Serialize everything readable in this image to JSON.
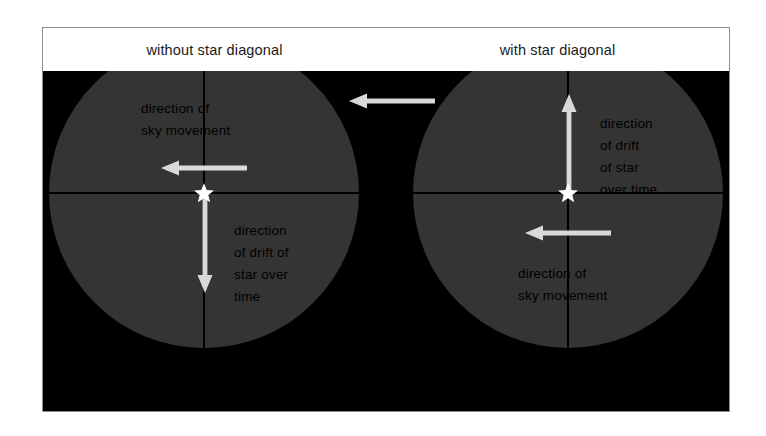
{
  "figure": {
    "headers": [
      {
        "label": "without star diagonal"
      },
      {
        "label": "with star diagonal"
      }
    ],
    "panel_background": "#000000",
    "disc_fill": "#343434",
    "arrow_color": "#d9d9d9",
    "star_color": "#ffffff",
    "crosshair_color": "#000000"
  },
  "views": [
    {
      "name": "without-star-diagonal",
      "star_label": "star-marker",
      "captions": {
        "sky": "direction of\nsky movement",
        "drift": "direction\nof drift of\nstar over\ntime"
      },
      "arrows": {
        "sky": "left",
        "drift": "down"
      }
    },
    {
      "name": "with-star-diagonal",
      "star_label": "star-marker",
      "captions": {
        "drift": "direction\nof drift\nof star\nover time",
        "sky": "direction of\nsky movement"
      },
      "arrows": {
        "drift": "up",
        "sky": "left"
      }
    }
  ],
  "center_arrow": {
    "direction": "left",
    "name": "sky-movement-reference-arrow"
  }
}
